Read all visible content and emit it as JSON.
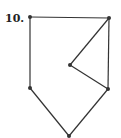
{
  "problem": {
    "number_label": "10."
  },
  "figure": {
    "stroke_color": "#333333",
    "vertices": [
      {
        "id": "A",
        "x": 30,
        "y": 17
      },
      {
        "id": "B",
        "x": 109,
        "y": 18
      },
      {
        "id": "C",
        "x": 70,
        "y": 65
      },
      {
        "id": "D",
        "x": 108,
        "y": 89
      },
      {
        "id": "E",
        "x": 69,
        "y": 136
      },
      {
        "id": "F",
        "x": 30,
        "y": 88
      }
    ],
    "edges": [
      [
        "A",
        "B"
      ],
      [
        "B",
        "C"
      ],
      [
        "C",
        "D"
      ],
      [
        "B",
        "D"
      ],
      [
        "D",
        "E"
      ],
      [
        "E",
        "F"
      ],
      [
        "F",
        "A"
      ]
    ]
  }
}
